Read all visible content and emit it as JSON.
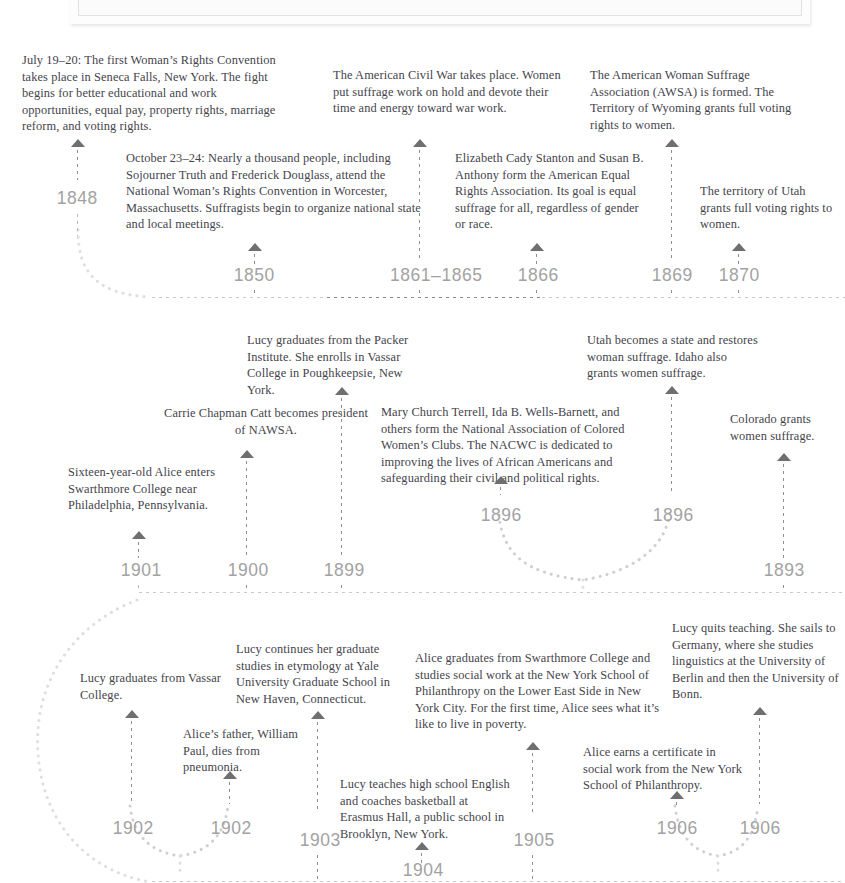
{
  "document": {
    "type": "historical-timeline-infographic",
    "subject": "Women's suffrage and the lives of Alice Paul and Lucy Burns",
    "photo_caption_frame": "image-partially-cropped-at-top"
  },
  "colors": {
    "body_text": "#44444c",
    "year_label": "#a2a2a2",
    "arrow": "#6f6f6f",
    "rail_dot": "#c9c9c9",
    "rail_dot_dark": "#8a8a8a",
    "page_background": "#ffffff"
  },
  "rows": [
    {
      "id": "row-1",
      "direction": "left-to-right",
      "events": [
        {
          "year": "1848",
          "text": "July 19–20: The first Woman’s Rights Convention takes place in Seneca Falls, New York. The fight begins for better educational and work opportunities, equal pay, property rights, marriage reform, and voting rights.",
          "tier": "upper"
        },
        {
          "year": "1850",
          "text": "October 23–24: Nearly a thousand people, including Sojourner Truth and Frederick Douglass, attend the National Woman’s Rights Convention in Worcester, Massachusetts. Suffragists begin to organize national state and local meetings.",
          "tier": "lower"
        },
        {
          "year": "1861–1865",
          "text": "The American Civil War takes place. Women put suffrage work on hold and devote their time and energy toward war work.",
          "tier": "upper"
        },
        {
          "year": "1866",
          "text": "Elizabeth Cady Stanton and Susan B. Anthony form the American Equal Rights Association. Its goal is equal suffrage for all, regardless of gender or race.",
          "tier": "lower"
        },
        {
          "year": "1869",
          "text": "The American Woman Suffrage Association (AWSA) is formed. The Territory of Wyoming grants full voting rights to women.",
          "tier": "upper"
        },
        {
          "year": "1870",
          "text": "The territory of Utah grants full voting rights to women.",
          "tier": "lower"
        }
      ]
    },
    {
      "id": "row-2",
      "direction": "right-to-left",
      "events": [
        {
          "year": "1901",
          "text": "Sixteen-year-old Alice enters Swarthmore College near Philadelphia, Pennsylvania.",
          "tier": "lower"
        },
        {
          "year": "1900",
          "text": "Carrie Chapman Catt becomes president of NAWSA.",
          "tier": "mid"
        },
        {
          "year": "1899",
          "text": "Lucy graduates from the Packer Institute. She enrolls in Vassar College in Poughkeepsie, New York.",
          "tier": "upper"
        },
        {
          "year": "1896",
          "text": "Mary Church Terrell, Ida B. Wells-Barnett, and others form the National Association of Colored Women’s Clubs. The NACWC is dedicated to improving the lives of African Americans and safeguarding their civil and political rights.",
          "tier": "branch-left"
        },
        {
          "year": "1896",
          "text": "Utah becomes a state and restores woman suffrage. Idaho also grants women suffrage.",
          "tier": "branch-right"
        },
        {
          "year": "1893",
          "text": "Colorado grants women suffrage.",
          "tier": "lower"
        }
      ]
    },
    {
      "id": "row-3",
      "direction": "left-to-right",
      "events": [
        {
          "year": "1902",
          "text": "Lucy graduates from Vassar College.",
          "tier": "branch-left"
        },
        {
          "year": "1902",
          "text": "Alice’s father, William Paul, dies from pneumonia.",
          "tier": "branch-right"
        },
        {
          "year": "1903",
          "text": "Lucy continues her graduate studies in etymology at Yale University Graduate School in New Haven, Connecticut.",
          "tier": "upper"
        },
        {
          "year": "1904",
          "text": "Lucy teaches high school English and coaches basketball at Erasmus Hall, a public school in Brooklyn, New York.",
          "tier": "lower"
        },
        {
          "year": "1905",
          "text": "Alice graduates from Swarthmore College and studies social work at the New York School of Philanthropy on the Lower East Side in New York City. For the first time, Alice sees what it’s like to live in poverty.",
          "tier": "upper"
        },
        {
          "year": "1906",
          "text": "Alice earns a certificate in social work from the New York School of Philanthropy.",
          "tier": "branch-left"
        },
        {
          "year": "1906",
          "text": "Lucy quits teaching. She sails to Germany, where she studies linguistics at the University of Berlin and then the University of Bonn.",
          "tier": "branch-right"
        }
      ]
    }
  ]
}
